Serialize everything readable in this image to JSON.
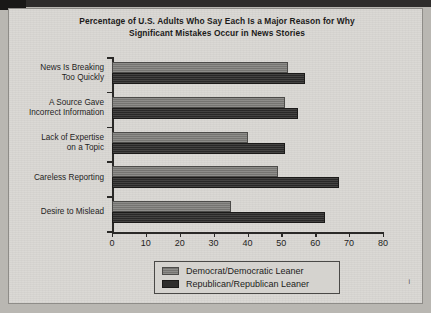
{
  "chart_data": {
    "type": "bar",
    "orientation": "horizontal",
    "title": "Percentage of U.S. Adults Who Say Each Is a Major Reason for Why Significant Mistakes Occur in News Stories",
    "title_line1": "Percentage of U.S. Adults Who Say Each Is a Major Reason for Why",
    "title_line2": "Significant Mistakes Occur in News Stories",
    "xlabel": "",
    "ylabel": "",
    "xlim": [
      0,
      80
    ],
    "grid": false,
    "legend_position": "bottom-center",
    "xticks": [
      "0",
      "10",
      "20",
      "30",
      "40",
      "50",
      "60",
      "70",
      "80"
    ],
    "xtick_values": [
      0,
      10,
      20,
      30,
      40,
      50,
      60,
      70,
      80
    ],
    "categories": [
      "News Is Breaking Too Quickly",
      "A Source Gave Incorrect Information",
      "Lack of Expertise on a Topic",
      "Careless Reporting",
      "Desire to Mislead"
    ],
    "category_lines": [
      [
        "News Is Breaking",
        "Too Quickly"
      ],
      [
        "A Source Gave",
        "Incorrect Information"
      ],
      [
        "Lack of Expertise",
        "on a Topic"
      ],
      [
        "Careless Reporting"
      ],
      [
        "Desire to Mislead"
      ]
    ],
    "series": [
      {
        "name": "Democrat/Democratic Leaner",
        "color": "#7b7a77",
        "values": [
          52,
          51,
          40,
          49,
          35
        ]
      },
      {
        "name": "Republican/Republican Leaner",
        "color": "#2f2e2d",
        "values": [
          57,
          55,
          51,
          67,
          63
        ]
      }
    ]
  },
  "legend": {
    "items": [
      {
        "label": "Democrat/Democratic Leaner"
      },
      {
        "label": "Republican/Republican Leaner"
      }
    ]
  },
  "page": {
    "corner_mark": "i"
  }
}
